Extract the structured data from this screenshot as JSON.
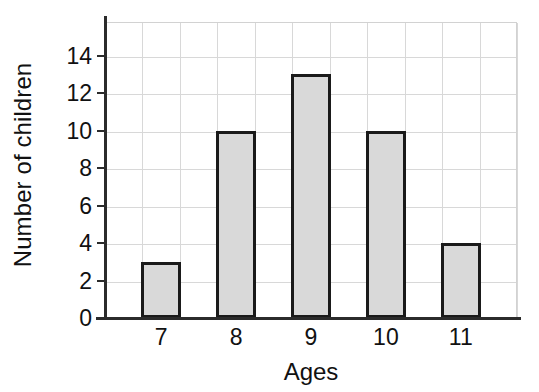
{
  "chart_data": {
    "type": "bar",
    "title": "",
    "xlabel": "Ages",
    "ylabel": "Number of children",
    "categories": [
      "7",
      "8",
      "9",
      "10",
      "11"
    ],
    "values": [
      3,
      10,
      13,
      10,
      4
    ],
    "series": [
      {
        "name": "Number of children",
        "values": [
          3,
          10,
          13,
          10,
          4
        ]
      }
    ],
    "ylim": [
      0,
      15.8
    ],
    "yticks": [
      0,
      2,
      4,
      6,
      8,
      10,
      12,
      14
    ],
    "ytick_labels": [
      "0",
      "2",
      "4",
      "6",
      "8",
      "10",
      "12",
      "14"
    ],
    "xtick_labels": [
      "7",
      "8",
      "9",
      "10",
      "11"
    ],
    "grid": true,
    "grid_axis": "both",
    "legend": false,
    "legend_position": "none",
    "bar_fill_color": "#d9d9d9",
    "bar_edge_color": "#1a1a1a",
    "gridline_color": "#d8d8d8",
    "axis_color": "#2b2b2b",
    "background_color": "#ffffff",
    "vertical_gridline_count": 11,
    "bar_count": 5
  }
}
